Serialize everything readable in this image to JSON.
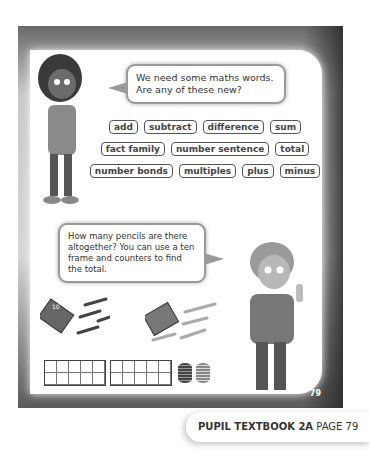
{
  "bubbles": {
    "top": "We need some maths words. Are any of these new?",
    "bottom": "How many pencils are there altogether? You can use a ten frame and counters to find the total."
  },
  "vocabulary": {
    "rows": [
      [
        "add",
        "subtract",
        "difference",
        "sum"
      ],
      [
        "fact family",
        "number sentence",
        "total"
      ],
      [
        "number bonds",
        "multiples",
        "plus",
        "minus"
      ]
    ]
  },
  "pencil_boxes": [
    {
      "label": "10"
    },
    {
      "label": "10"
    }
  ],
  "page_number": "79",
  "footer": {
    "book": "PUPIL TEXTBOOK 2A",
    "page": "PAGE 79"
  }
}
